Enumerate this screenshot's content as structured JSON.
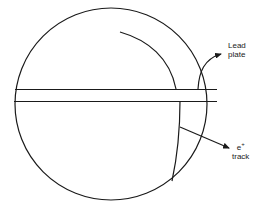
{
  "diagram": {
    "labels": {
      "lead_plate_line1": "Lead",
      "lead_plate_line2": "plate",
      "track_particle": "e",
      "track_charge": "+",
      "track_word": "track"
    },
    "colors": {
      "stroke": "#1a1a1a",
      "background": "#ffffff"
    },
    "elements": [
      "chamber-circle",
      "lead-plate",
      "upper-track-arc",
      "lower-track-arc",
      "lead-plate-pointer-arrow",
      "positron-track-pointer-arrow"
    ]
  }
}
